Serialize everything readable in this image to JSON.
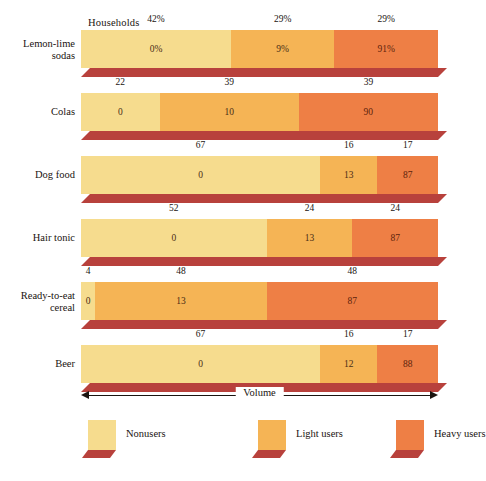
{
  "header": {
    "households_label": "Households"
  },
  "axis": {
    "volume_label": "Volume",
    "left_arrow_icon": "arrow-left-icon",
    "right_arrow_icon": "arrow-right-icon"
  },
  "legend": {
    "position": "bottom",
    "items": [
      {
        "label": "Nonusers",
        "color": "#f6dc8e"
      },
      {
        "label": "Light users",
        "color": "#f5b455"
      },
      {
        "label": "Heavy users",
        "color": "#ee7f45"
      }
    ]
  },
  "colors": {
    "nonusers": "#f6dc8e",
    "light_users": "#f5b455",
    "heavy_users": "#ee7f45",
    "base_shadow": "#b8413c",
    "background": "#ffffff",
    "text": "#1a1410"
  },
  "chart_data": {
    "type": "bar",
    "title": "",
    "subtitle": "",
    "xlabel": "Volume",
    "ylabel": "",
    "orientation": "horizontal",
    "stacked": true,
    "stack_total": 100,
    "grid": false,
    "legend_position": "bottom",
    "top_axis_label": "Households",
    "categories": [
      "Lemon-lime\nsodas",
      "Colas",
      "Dog food",
      "Hair tonic",
      "Ready-to-eat\ncereal",
      "Beer"
    ],
    "series": [
      {
        "name": "Nonusers",
        "households": [
          42,
          22,
          67,
          52,
          4,
          67
        ],
        "volume": [
          "0%",
          "0",
          "0",
          "0",
          "0",
          "0"
        ]
      },
      {
        "name": "Light users",
        "households": [
          29,
          39,
          16,
          24,
          48,
          16
        ],
        "volume": [
          "9%",
          "10",
          "13",
          "13",
          "13",
          "12"
        ]
      },
      {
        "name": "Heavy users",
        "households": [
          29,
          39,
          17,
          24,
          48,
          17
        ],
        "volume": [
          "91%",
          "90",
          "87",
          "87",
          "87",
          "88"
        ]
      }
    ],
    "rows": [
      {
        "category": "Lemon-lime\nsodas",
        "segments": [
          {
            "name": "Nonusers",
            "households_pct": 42,
            "households_label": "42%",
            "volume_label": "0%"
          },
          {
            "name": "Light users",
            "households_pct": 29,
            "households_label": "29%",
            "volume_label": "9%"
          },
          {
            "name": "Heavy users",
            "households_pct": 29,
            "households_label": "29%",
            "volume_label": "91%"
          }
        ]
      },
      {
        "category": "Colas",
        "segments": [
          {
            "name": "Nonusers",
            "households_pct": 22,
            "households_label": "22",
            "volume_label": "0"
          },
          {
            "name": "Light users",
            "households_pct": 39,
            "households_label": "39",
            "volume_label": "10"
          },
          {
            "name": "Heavy users",
            "households_pct": 39,
            "households_label": "39",
            "volume_label": "90"
          }
        ]
      },
      {
        "category": "Dog food",
        "segments": [
          {
            "name": "Nonusers",
            "households_pct": 67,
            "households_label": "67",
            "volume_label": "0"
          },
          {
            "name": "Light users",
            "households_pct": 16,
            "households_label": "16",
            "volume_label": "13"
          },
          {
            "name": "Heavy users",
            "households_pct": 17,
            "households_label": "17",
            "volume_label": "87"
          }
        ]
      },
      {
        "category": "Hair tonic",
        "segments": [
          {
            "name": "Nonusers",
            "households_pct": 52,
            "households_label": "52",
            "volume_label": "0"
          },
          {
            "name": "Light users",
            "households_pct": 24,
            "households_label": "24",
            "volume_label": "13"
          },
          {
            "name": "Heavy users",
            "households_pct": 24,
            "households_label": "24",
            "volume_label": "87"
          }
        ]
      },
      {
        "category": "Ready-to-eat\ncereal",
        "segments": [
          {
            "name": "Nonusers",
            "households_pct": 4,
            "households_label": "4",
            "volume_label": "0"
          },
          {
            "name": "Light users",
            "households_pct": 48,
            "households_label": "48",
            "volume_label": "13"
          },
          {
            "name": "Heavy users",
            "households_pct": 48,
            "households_label": "48",
            "volume_label": "87"
          }
        ]
      },
      {
        "category": "Beer",
        "segments": [
          {
            "name": "Nonusers",
            "households_pct": 67,
            "households_label": "67",
            "volume_label": "0"
          },
          {
            "name": "Light users",
            "households_pct": 16,
            "households_label": "16",
            "volume_label": "12"
          },
          {
            "name": "Heavy users",
            "households_pct": 17,
            "households_label": "17",
            "volume_label": "88"
          }
        ]
      }
    ]
  }
}
